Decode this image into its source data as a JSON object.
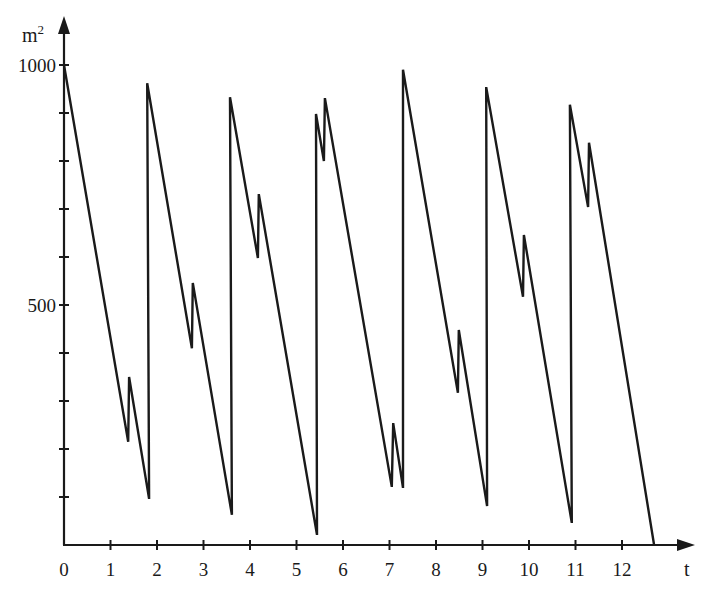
{
  "chart_data": {
    "type": "line",
    "title": "",
    "xlabel": "t",
    "ylabel": "m²",
    "ylabel_base": "m",
    "ylabel_sup": "2",
    "xlim": [
      0,
      13.5
    ],
    "ylim": [
      0,
      1050
    ],
    "grid": false,
    "legend": null,
    "x_ticks": [
      0,
      1,
      2,
      3,
      4,
      5,
      6,
      7,
      8,
      9,
      10,
      11,
      12
    ],
    "x_tick_labels": [
      "0",
      "1",
      "2",
      "3",
      "4",
      "5",
      "6",
      "7",
      "8",
      "9",
      "10",
      "11",
      "12"
    ],
    "y_ticks": [
      100,
      200,
      300,
      400,
      500,
      600,
      700,
      800,
      900,
      1000
    ],
    "y_tick_labels": {
      "500": "500",
      "1000": "1000"
    },
    "line_color": "#1a1a1a",
    "series": [
      {
        "name": "area",
        "points": [
          [
            0.0,
            1000
          ],
          [
            1.38,
            215
          ],
          [
            1.4,
            350
          ],
          [
            1.83,
            96
          ],
          [
            1.79,
            962
          ],
          [
            2.75,
            410
          ],
          [
            2.77,
            546
          ],
          [
            3.61,
            63
          ],
          [
            3.57,
            933
          ],
          [
            4.17,
            598
          ],
          [
            4.19,
            731
          ],
          [
            5.44,
            21
          ],
          [
            5.42,
            898
          ],
          [
            5.59,
            800
          ],
          [
            5.61,
            931
          ],
          [
            7.05,
            121
          ],
          [
            7.08,
            254
          ],
          [
            7.29,
            119
          ],
          [
            7.29,
            990
          ],
          [
            8.47,
            317
          ],
          [
            8.49,
            448
          ],
          [
            9.1,
            81
          ],
          [
            9.08,
            954
          ],
          [
            9.87,
            517
          ],
          [
            9.89,
            646
          ],
          [
            10.92,
            46
          ],
          [
            10.88,
            917
          ],
          [
            11.27,
            704
          ],
          [
            11.29,
            838
          ],
          [
            12.69,
            0
          ]
        ]
      }
    ]
  }
}
